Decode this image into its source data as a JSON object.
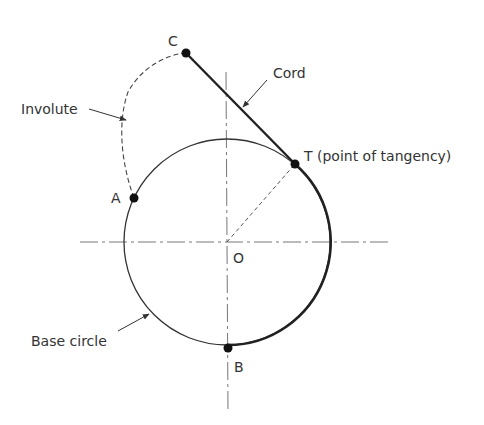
{
  "diagram": {
    "labels": {
      "C": "C",
      "cord": "Cord",
      "involute": "Involute",
      "T": "T (point of tangency)",
      "A": "A",
      "O": "O",
      "base_circle": "Base circle",
      "B": "B"
    },
    "colors": {
      "stroke": "#222222",
      "text": "#333333",
      "centerline": "#555555"
    }
  }
}
